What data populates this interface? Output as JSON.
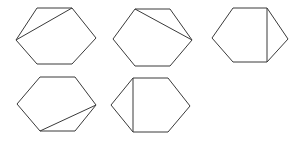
{
  "figure": {
    "background_color": "#ffffff",
    "stroke_color": "#3a3a3a",
    "stroke_width": 1,
    "canvas": {
      "width": 299,
      "height": 143
    },
    "rows": [
      {
        "label": "top-row",
        "count": 3
      },
      {
        "label": "bottom-row",
        "count": 2
      }
    ],
    "shapes": [
      {
        "id": "hexagon-1",
        "position": "top-left",
        "row": 1,
        "column": 1,
        "outline_points": "37,8 72,8 96,38 72,64 37,64 16,40",
        "vertices": [
          {
            "name": "top-left",
            "x": 37,
            "y": 8
          },
          {
            "name": "top-right",
            "x": 72,
            "y": 8
          },
          {
            "name": "right",
            "x": 96,
            "y": 38
          },
          {
            "name": "bottom-right",
            "x": 72,
            "y": 64
          },
          {
            "name": "bottom-left",
            "x": 37,
            "y": 64
          },
          {
            "name": "left",
            "x": 16,
            "y": 40
          }
        ],
        "diagonal": {
          "from": "top-right",
          "to": "left",
          "x1": 72,
          "y1": 8,
          "x2": 16,
          "y2": 40
        }
      },
      {
        "id": "hexagon-2",
        "position": "top-center",
        "row": 1,
        "column": 2,
        "outline_points": "135,9 170,9 192,40 170,66 135,66 113,39",
        "vertices": [
          {
            "name": "top-left",
            "x": 135,
            "y": 9
          },
          {
            "name": "top-right",
            "x": 170,
            "y": 9
          },
          {
            "name": "right",
            "x": 192,
            "y": 40
          },
          {
            "name": "bottom-right",
            "x": 170,
            "y": 66
          },
          {
            "name": "bottom-left",
            "x": 135,
            "y": 66
          },
          {
            "name": "left",
            "x": 113,
            "y": 39
          }
        ],
        "diagonal": {
          "from": "top-left",
          "to": "right",
          "x1": 135,
          "y1": 9,
          "x2": 192,
          "y2": 40
        }
      },
      {
        "id": "hexagon-3",
        "position": "top-right",
        "row": 1,
        "column": 3,
        "outline_points": "233,8 267,8 288,39 267,62 233,62 212,38",
        "vertices": [
          {
            "name": "top-left",
            "x": 233,
            "y": 8
          },
          {
            "name": "top-right",
            "x": 267,
            "y": 8
          },
          {
            "name": "right",
            "x": 288,
            "y": 39
          },
          {
            "name": "bottom-right",
            "x": 267,
            "y": 62
          },
          {
            "name": "bottom-left",
            "x": 233,
            "y": 62
          },
          {
            "name": "left",
            "x": 212,
            "y": 38
          }
        ],
        "diagonal": {
          "from": "top-right",
          "to": "bottom-right",
          "x1": 267,
          "y1": 8,
          "x2": 267,
          "y2": 62
        }
      },
      {
        "id": "hexagon-4",
        "position": "bottom-left",
        "row": 2,
        "column": 1,
        "outline_points": "40,77 75,77 96,105 75,131 40,131 17,104",
        "vertices": [
          {
            "name": "top-left",
            "x": 40,
            "y": 77
          },
          {
            "name": "top-right",
            "x": 75,
            "y": 77
          },
          {
            "name": "right",
            "x": 96,
            "y": 105
          },
          {
            "name": "bottom-right",
            "x": 75,
            "y": 131
          },
          {
            "name": "bottom-left",
            "x": 40,
            "y": 131
          },
          {
            "name": "left",
            "x": 17,
            "y": 104
          }
        ],
        "diagonal": {
          "from": "right",
          "to": "bottom-left",
          "x1": 96,
          "y1": 105,
          "x2": 40,
          "y2": 131
        }
      },
      {
        "id": "hexagon-5",
        "position": "bottom-center",
        "row": 2,
        "column": 2,
        "outline_points": "133,78 168,78 190,106 168,132 133,132 111,105",
        "vertices": [
          {
            "name": "top-left",
            "x": 133,
            "y": 78
          },
          {
            "name": "top-right",
            "x": 168,
            "y": 78
          },
          {
            "name": "right",
            "x": 190,
            "y": 106
          },
          {
            "name": "bottom-right",
            "x": 168,
            "y": 132
          },
          {
            "name": "bottom-left",
            "x": 133,
            "y": 132
          },
          {
            "name": "left",
            "x": 111,
            "y": 105
          }
        ],
        "diagonal": {
          "from": "top-left",
          "to": "bottom-left",
          "x1": 133,
          "y1": 78,
          "x2": 133,
          "y2": 132
        }
      }
    ]
  }
}
